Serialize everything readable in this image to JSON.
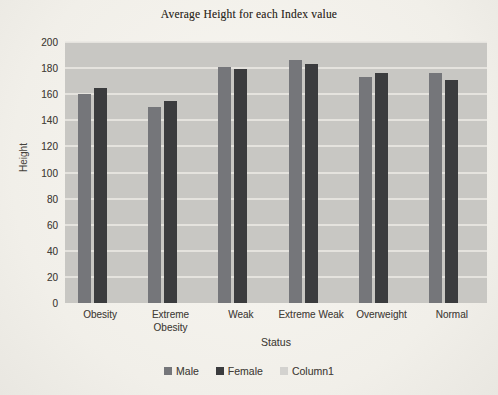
{
  "chart_data": {
    "type": "bar",
    "title": "Average Height for each Index value",
    "xlabel": "Status",
    "ylabel": "Height",
    "ylim": [
      0,
      200
    ],
    "ytick_step": 20,
    "grid": true,
    "legend_position": "bottom",
    "plot_bg": "#c8c7c3",
    "gridline_color": "#eae8e3",
    "categories": [
      "Obesity",
      "Extreme Obesity",
      "Weak",
      "Extreme Weak",
      "Overweight",
      "Normal"
    ],
    "series": [
      {
        "name": "Male",
        "color": "#75767a",
        "values": [
          160,
          150,
          181,
          186,
          173,
          176
        ]
      },
      {
        "name": "Female",
        "color": "#3b3c3e",
        "values": [
          165,
          155,
          179,
          183,
          176,
          171
        ]
      },
      {
        "name": "Column1",
        "color": "#d3d2cf",
        "values": [
          null,
          null,
          null,
          null,
          null,
          null
        ]
      }
    ]
  }
}
